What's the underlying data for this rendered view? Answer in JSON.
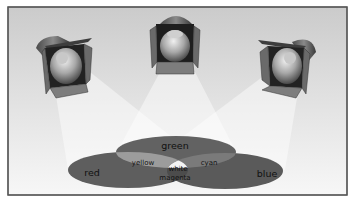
{
  "diagram": {
    "type": "additive-color-mixing",
    "lights": [
      {
        "id": "left",
        "beam_color": "red"
      },
      {
        "id": "center",
        "beam_color": "green"
      },
      {
        "id": "right",
        "beam_color": "blue"
      }
    ],
    "labels": {
      "green": "green",
      "red": "red",
      "blue": "blue",
      "yellow": "yellow",
      "cyan": "cyan",
      "white": "white",
      "magenta": "magenta"
    },
    "colors": {
      "background_top": "#cfcfcf",
      "background_bottom": "#f6f6f6",
      "frame": "#555555",
      "ellipse_dark": "#5c5c5c",
      "overlap_light": "#9a9a9a",
      "white_center": "#f4f4f4",
      "beam": "#ffffff"
    }
  }
}
